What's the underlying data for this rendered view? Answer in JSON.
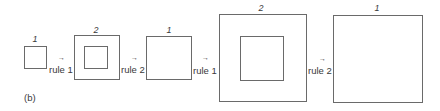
{
  "figure": {
    "caption": "(b)",
    "steps": [
      {
        "label": "1",
        "has_inner": false
      },
      {
        "label": "2",
        "has_inner": true
      },
      {
        "label": "1",
        "has_inner": false
      },
      {
        "label": "2",
        "has_inner": true
      },
      {
        "label": "1",
        "has_inner": false
      }
    ],
    "transitions": [
      {
        "arrow": "→",
        "rule": "rule 1"
      },
      {
        "arrow": "→",
        "rule": "rule 2"
      },
      {
        "arrow": "→",
        "rule": "rule 1"
      },
      {
        "arrow": "→",
        "rule": "rule 2"
      }
    ]
  }
}
